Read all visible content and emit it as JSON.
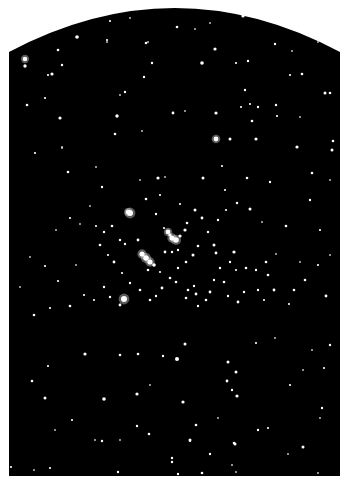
{
  "image": {
    "subject": "Open star cluster photograph",
    "background_color": "#ffffff",
    "sky_color": "#000000",
    "star_color": "#ffffff",
    "plate": {
      "left": 9,
      "right": 340,
      "top_center": 7,
      "top_edge": 52,
      "bottom": 476
    }
  },
  "stars": [
    [
      77,
      37,
      1.8
    ],
    [
      110,
      21,
      1.1
    ],
    [
      130,
      18,
      1.0
    ],
    [
      177,
      27,
      1.3
    ],
    [
      195,
      29,
      1.0
    ],
    [
      210,
      23,
      1.0
    ],
    [
      243,
      16,
      1.6
    ],
    [
      275,
      44,
      1.2
    ],
    [
      148,
      42,
      1.0
    ],
    [
      25,
      59,
      2.3
    ],
    [
      58,
      50,
      1.3
    ],
    [
      107,
      42,
      1.0
    ],
    [
      146,
      43,
      1.3
    ],
    [
      107,
      40,
      1.1
    ],
    [
      215,
      49,
      1.6
    ],
    [
      248,
      61,
      1.2
    ],
    [
      292,
      51,
      1.0
    ],
    [
      318,
      42,
      0.9
    ],
    [
      25,
      66,
      1.7
    ],
    [
      52,
      74,
      1.6
    ],
    [
      62,
      65,
      1.2
    ],
    [
      48,
      75,
      1.1
    ],
    [
      152,
      63,
      1.2
    ],
    [
      202,
      63,
      1.8
    ],
    [
      236,
      63,
      1.1
    ],
    [
      290,
      75,
      1.1
    ],
    [
      302,
      74,
      1.3
    ],
    [
      325,
      93,
      1.5
    ],
    [
      330,
      93,
      1.3
    ],
    [
      245,
      90,
      1.2
    ],
    [
      125,
      92,
      1.2
    ],
    [
      120,
      95,
      1.0
    ],
    [
      45,
      98,
      1.1
    ],
    [
      27,
      105,
      1.3
    ],
    [
      276,
      105,
      1.2
    ],
    [
      60,
      118,
      1.6
    ],
    [
      117,
      116,
      1.7
    ],
    [
      173,
      113,
      1.4
    ],
    [
      185,
      111,
      1.0
    ],
    [
      216,
      113,
      1.6
    ],
    [
      241,
      107,
      1.1
    ],
    [
      250,
      104,
      1.1
    ],
    [
      258,
      107,
      1.2
    ],
    [
      252,
      121,
      1.3
    ],
    [
      277,
      116,
      1.1
    ],
    [
      300,
      117,
      1.0
    ],
    [
      62,
      147,
      1.0
    ],
    [
      115,
      134,
      1.3
    ],
    [
      142,
      131,
      1.0
    ],
    [
      216,
      139,
      2.4
    ],
    [
      230,
      139,
      1.5
    ],
    [
      256,
      139,
      1.6
    ],
    [
      297,
      147,
      1.6
    ],
    [
      333,
      141,
      1.3
    ],
    [
      332,
      150,
      1.5
    ],
    [
      35,
      153,
      1.1
    ],
    [
      62,
      148,
      1.0
    ],
    [
      68,
      172,
      1.3
    ],
    [
      96,
      167,
      1.0
    ],
    [
      158,
      178,
      1.6
    ],
    [
      165,
      177,
      1.0
    ],
    [
      203,
      178,
      1.5
    ],
    [
      222,
      166,
      1.1
    ],
    [
      247,
      178,
      1.3
    ],
    [
      270,
      182,
      1.2
    ],
    [
      312,
      173,
      1.3
    ],
    [
      330,
      180,
      1.0
    ],
    [
      144,
      77,
      1.2
    ],
    [
      128,
      212,
      2.2
    ],
    [
      102,
      187,
      1.2
    ],
    [
      130,
      213,
      3.0
    ],
    [
      146,
      199,
      1.3
    ],
    [
      156,
      214,
      1.2
    ],
    [
      164,
      228,
      1.1
    ],
    [
      170,
      235,
      1.6
    ],
    [
      172,
      238,
      2.6
    ],
    [
      176,
      240,
      2.8
    ],
    [
      168,
      232,
      2.4
    ],
    [
      180,
      236,
      1.6
    ],
    [
      185,
      230,
      1.6
    ],
    [
      187,
      223,
      1.3
    ],
    [
      195,
      210,
      1.5
    ],
    [
      202,
      218,
      1.4
    ],
    [
      214,
      245,
      1.5
    ],
    [
      216,
      253,
      1.4
    ],
    [
      220,
      268,
      1.2
    ],
    [
      230,
      262,
      1.2
    ],
    [
      234,
      252,
      1.6
    ],
    [
      236,
      270,
      1.1
    ],
    [
      246,
      268,
      1.3
    ],
    [
      250,
      209,
      1.5
    ],
    [
      237,
      203,
      1.2
    ],
    [
      226,
      210,
      1.1
    ],
    [
      218,
      220,
      1.2
    ],
    [
      208,
      232,
      1.2
    ],
    [
      198,
      246,
      1.3
    ],
    [
      193,
      255,
      1.5
    ],
    [
      186,
      262,
      1.3
    ],
    [
      178,
      268,
      1.2
    ],
    [
      170,
      278,
      1.3
    ],
    [
      162,
      288,
      1.4
    ],
    [
      156,
      296,
      1.2
    ],
    [
      150,
      300,
      1.3
    ],
    [
      140,
      290,
      1.3
    ],
    [
      130,
      283,
      1.2
    ],
    [
      122,
      273,
      1.1
    ],
    [
      114,
      262,
      1.4
    ],
    [
      108,
      255,
      1.1
    ],
    [
      100,
      245,
      1.3
    ],
    [
      96,
      226,
      1.1
    ],
    [
      104,
      232,
      1.2
    ],
    [
      112,
      226,
      1.3
    ],
    [
      120,
      240,
      1.2
    ],
    [
      125,
      244,
      1.2
    ],
    [
      138,
      240,
      1.4
    ],
    [
      142,
      254,
      2.6
    ],
    [
      146,
      258,
      2.8
    ],
    [
      150,
      262,
      2.6
    ],
    [
      154,
      265,
      1.8
    ],
    [
      148,
      270,
      1.3
    ],
    [
      160,
      272,
      1.1
    ],
    [
      165,
      252,
      1.4
    ],
    [
      172,
      252,
      1.2
    ],
    [
      178,
      250,
      1.2
    ],
    [
      176,
      282,
      1.3
    ],
    [
      188,
      290,
      1.3
    ],
    [
      194,
      286,
      1.2
    ],
    [
      196,
      294,
      1.4
    ],
    [
      186,
      298,
      1.3
    ],
    [
      198,
      306,
      1.2
    ],
    [
      206,
      300,
      1.3
    ],
    [
      210,
      292,
      1.4
    ],
    [
      214,
      280,
      1.2
    ],
    [
      224,
      282,
      1.3
    ],
    [
      228,
      296,
      1.2
    ],
    [
      238,
      302,
      1.4
    ],
    [
      244,
      292,
      1.2
    ],
    [
      256,
      270,
      1.2
    ],
    [
      266,
      262,
      1.3
    ],
    [
      276,
      254,
      1.0
    ],
    [
      268,
      275,
      1.3
    ],
    [
      258,
      290,
      1.2
    ],
    [
      264,
      300,
      1.1
    ],
    [
      274,
      290,
      1.4
    ],
    [
      289,
      304,
      1.1
    ],
    [
      294,
      290,
      1.3
    ],
    [
      300,
      262,
      1.0
    ],
    [
      305,
      280,
      1.3
    ],
    [
      318,
      265,
      1.1
    ],
    [
      326,
      296,
      1.4
    ],
    [
      330,
      255,
      1.0
    ],
    [
      124,
      299,
      3.0
    ],
    [
      120,
      305,
      1.4
    ],
    [
      110,
      297,
      1.2
    ],
    [
      104,
      287,
      1.2
    ],
    [
      94,
      300,
      1.1
    ],
    [
      84,
      295,
      1.1
    ],
    [
      70,
      306,
      1.3
    ],
    [
      58,
      281,
      1.1
    ],
    [
      76,
      265,
      1.0
    ],
    [
      45,
      266,
      1.1
    ],
    [
      30,
      257,
      1.0
    ],
    [
      20,
      287,
      1.0
    ],
    [
      34,
      315,
      1.3
    ],
    [
      50,
      308,
      1.1
    ],
    [
      80,
      224,
      1.0
    ],
    [
      70,
      218,
      1.1
    ],
    [
      56,
      230,
      1.0
    ],
    [
      90,
      206,
      1.0
    ],
    [
      160,
      195,
      1.1
    ],
    [
      180,
      204,
      1.1
    ],
    [
      140,
      180,
      1.0
    ],
    [
      225,
      190,
      1.1
    ],
    [
      262,
      222,
      1.0
    ],
    [
      286,
      226,
      1.3
    ],
    [
      310,
      200,
      1.2
    ],
    [
      320,
      230,
      1.1
    ],
    [
      185,
      344,
      1.5
    ],
    [
      85,
      354,
      1.6
    ],
    [
      120,
      355,
      1.3
    ],
    [
      138,
      354,
      1.3
    ],
    [
      177,
      359,
      2.0
    ],
    [
      163,
      356,
      1.2
    ],
    [
      228,
      362,
      1.5
    ],
    [
      236,
      372,
      1.5
    ],
    [
      227,
      381,
      1.4
    ],
    [
      232,
      390,
      1.2
    ],
    [
      237,
      396,
      1.6
    ],
    [
      48,
      366,
      1.1
    ],
    [
      32,
      381,
      1.3
    ],
    [
      45,
      398,
      1.5
    ],
    [
      104,
      399,
      1.8
    ],
    [
      137,
      394,
      1.6
    ],
    [
      183,
      402,
      1.6
    ],
    [
      150,
      385,
      1.0
    ],
    [
      290,
      385,
      1.1
    ],
    [
      303,
      370,
      1.0
    ],
    [
      324,
      368,
      1.1
    ],
    [
      330,
      345,
      1.2
    ],
    [
      312,
      350,
      1.0
    ],
    [
      275,
      338,
      1.0
    ],
    [
      256,
      343,
      1.1
    ],
    [
      322,
      408,
      1.2
    ],
    [
      320,
      418,
      1.0
    ],
    [
      218,
      418,
      1.0
    ],
    [
      196,
      425,
      1.3
    ],
    [
      137,
      426,
      1.2
    ],
    [
      149,
      434,
      1.3
    ],
    [
      190,
      440,
      1.5
    ],
    [
      234,
      443,
      1.3
    ],
    [
      268,
      428,
      1.1
    ],
    [
      258,
      430,
      1.2
    ],
    [
      303,
      447,
      1.5
    ],
    [
      102,
      441,
      1.2
    ],
    [
      120,
      440,
      1.0
    ],
    [
      190,
      441,
      1.1
    ],
    [
      235,
      444,
      1.5
    ],
    [
      210,
      454,
      1.2
    ],
    [
      172,
      458,
      1.2
    ],
    [
      118,
      472,
      1.2
    ],
    [
      50,
      468,
      1.1
    ],
    [
      34,
      470,
      1.0
    ],
    [
      11,
      467,
      1.1
    ],
    [
      172,
      462,
      1.2
    ],
    [
      178,
      474,
      1.2
    ],
    [
      202,
      473,
      1.3
    ],
    [
      232,
      465,
      1.0
    ],
    [
      236,
      472,
      1.0
    ],
    [
      318,
      473,
      1.0
    ],
    [
      288,
      454,
      1.0
    ],
    [
      55,
      430,
      1.0
    ],
    [
      72,
      420,
      1.1
    ],
    [
      95,
      440,
      1.0
    ]
  ]
}
